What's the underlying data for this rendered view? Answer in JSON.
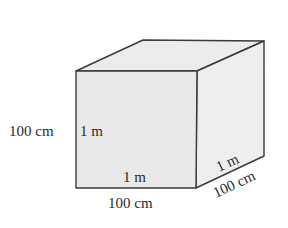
{
  "diagram": {
    "type": "cube",
    "colors": {
      "front_face": "#e9e9e9",
      "top_face": "#ececec",
      "side_face": "#eeeeee",
      "edge": "#3a3a3a",
      "text": "#2a2a2a"
    },
    "labels": {
      "height_outer": "100 cm",
      "height_inner": "1 m",
      "width_inner": "1 m",
      "width_outer": "100 cm",
      "depth_inner": "1 m",
      "depth_outer": "100 cm"
    }
  }
}
